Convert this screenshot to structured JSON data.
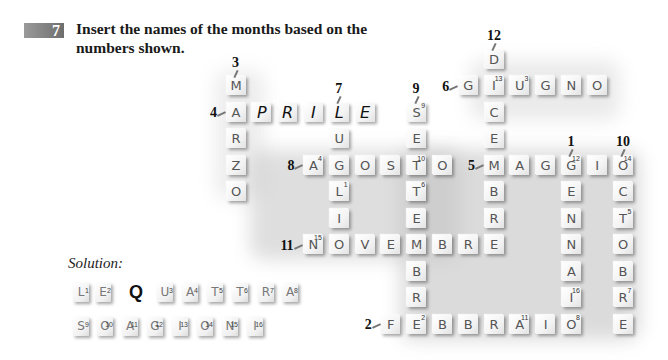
{
  "exercise": {
    "number": "7",
    "instruction_line1": "Insert the names of the months based on the",
    "instruction_line2": "numbers shown."
  },
  "grid": {
    "col0_x": 236,
    "col_pitch": 25.8,
    "row0_y": 59,
    "row_pitch": 26.5,
    "words": [
      {
        "clue": "1",
        "month": "GENNAIO",
        "dir": "down",
        "col": 13,
        "row": 4,
        "letters": [
          "G",
          "E",
          "N",
          "N",
          "A",
          "I",
          "O"
        ],
        "sups": [
          "12",
          "",
          "",
          "",
          "",
          "16",
          "8"
        ],
        "label_pos": "top"
      },
      {
        "clue": "2",
        "month": "FEBBRAIO",
        "dir": "across",
        "col": 6,
        "row": 10,
        "letters": [
          "F",
          "E",
          "B",
          "B",
          "R",
          "A",
          "I",
          "O"
        ],
        "sups": [
          "",
          "2",
          "",
          "",
          "",
          "11",
          "",
          "8"
        ],
        "label_pos": "left"
      },
      {
        "clue": "3",
        "month": "MARZO",
        "dir": "down",
        "col": 0,
        "row": 1,
        "letters": [
          "M",
          "A",
          "R",
          "Z",
          "O"
        ],
        "sups": [
          "",
          "",
          "",
          "",
          ""
        ],
        "label_pos": "top"
      },
      {
        "clue": "4",
        "month": "APRILE",
        "dir": "across",
        "col": 0,
        "row": 2,
        "letters": [
          "A",
          "P",
          "R",
          "I",
          "L",
          "E"
        ],
        "sups": [
          "",
          "",
          "",
          "",
          "",
          ""
        ],
        "label_pos": "left"
      },
      {
        "clue": "5",
        "month": "MAGGIO",
        "dir": "across",
        "col": 10,
        "row": 4,
        "letters": [
          "M",
          "A",
          "G",
          "G",
          "I",
          "O"
        ],
        "sups": [
          "",
          "",
          "",
          "12",
          "",
          "14"
        ],
        "label_pos": "left"
      },
      {
        "clue": "6",
        "month": "GIUGNO",
        "dir": "across",
        "col": 9,
        "row": 1,
        "letters": [
          "G",
          "I",
          "U",
          "G",
          "N",
          "O"
        ],
        "sups": [
          "",
          "13",
          "3",
          "",
          "",
          ""
        ],
        "label_pos": "left"
      },
      {
        "clue": "7",
        "month": "LUGLIO",
        "dir": "down",
        "col": 4,
        "row": 2,
        "letters": [
          "L",
          "U",
          "G",
          "L",
          "I",
          "O"
        ],
        "sups": [
          "",
          "",
          "",
          "1",
          "",
          ""
        ],
        "label_pos": "top"
      },
      {
        "clue": "8",
        "month": "AGOSTO",
        "dir": "across",
        "col": 3,
        "row": 4,
        "letters": [
          "A",
          "G",
          "O",
          "S",
          "T",
          "O"
        ],
        "sups": [
          "4",
          "",
          "",
          "",
          "10",
          ""
        ],
        "label_pos": "left"
      },
      {
        "clue": "9",
        "month": "SETTEMBRE",
        "dir": "down",
        "col": 7,
        "row": 2,
        "letters": [
          "S",
          "E",
          "T",
          "T",
          "E",
          "M",
          "B",
          "R",
          "E"
        ],
        "sups": [
          "9",
          "",
          "10",
          "6",
          "",
          "",
          "",
          "",
          "2"
        ],
        "label_pos": "top"
      },
      {
        "clue": "10",
        "month": "OTTOBRE",
        "dir": "down",
        "col": 15,
        "row": 4,
        "letters": [
          "O",
          "C",
          "T",
          "O",
          "B",
          "R",
          "E"
        ],
        "sups": [
          "14",
          "",
          "5",
          "",
          "",
          "7",
          ""
        ],
        "label_pos": "top"
      },
      {
        "clue": "11",
        "month": "NOVEMBRE",
        "dir": "across",
        "col": 3,
        "row": 7,
        "letters": [
          "N",
          "O",
          "V",
          "E",
          "M",
          "B",
          "R",
          "E"
        ],
        "sups": [
          "15",
          "",
          "",
          "",
          "",
          "",
          "",
          ""
        ],
        "label_pos": "left"
      },
      {
        "clue": "12",
        "month": "DICEMBRE",
        "dir": "down",
        "col": 10,
        "row": 0,
        "letters": [
          "D",
          "I",
          "C",
          "E",
          "M",
          "B",
          "R",
          "E"
        ],
        "sups": [
          "",
          "13",
          "",
          "",
          "",
          "",
          "",
          ""
        ],
        "label_pos": "top"
      }
    ]
  },
  "solution": {
    "label": "Solution:",
    "row1": [
      {
        "ch": "L",
        "sup": "1"
      },
      {
        "ch": "E",
        "sup": "2"
      },
      {
        "ch": "Q",
        "sup": "",
        "plain": true
      },
      {
        "ch": "U",
        "sup": "3"
      },
      {
        "ch": "A",
        "sup": "4"
      },
      {
        "ch": "T",
        "sup": "5"
      },
      {
        "ch": "T",
        "sup": "6"
      },
      {
        "ch": "R",
        "sup": "7"
      },
      {
        "ch": "A",
        "sup": "8"
      }
    ],
    "row2": [
      {
        "ch": "S",
        "sup": "9"
      },
      {
        "ch": "O",
        "sup": "10"
      },
      {
        "ch": "A",
        "sup": "11"
      },
      {
        "ch": "G",
        "sup": "12"
      },
      {
        "ch": "I",
        "sup": "13"
      },
      {
        "ch": "O",
        "sup": "14"
      },
      {
        "ch": "N",
        "sup": "15"
      },
      {
        "ch": "I",
        "sup": "16"
      }
    ]
  }
}
